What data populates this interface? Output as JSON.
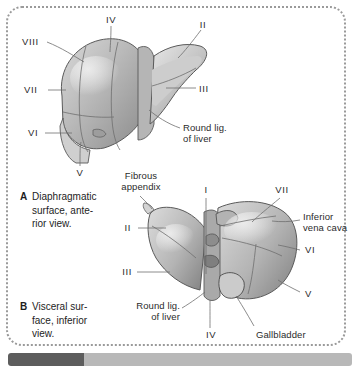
{
  "figure": {
    "panels": [
      {
        "tag": "A",
        "caption": "Diaphragmatic\nsurface, ante-\nrior view.",
        "view": "anterior",
        "labels": [
          {
            "id": "a-seg-8",
            "text": "VIII",
            "type": "segment"
          },
          {
            "id": "a-seg-7",
            "text": "VII",
            "type": "segment"
          },
          {
            "id": "a-seg-6",
            "text": "VI",
            "type": "segment"
          },
          {
            "id": "a-seg-5",
            "text": "V",
            "type": "segment"
          },
          {
            "id": "a-seg-4",
            "text": "IV",
            "type": "segment"
          },
          {
            "id": "a-seg-2",
            "text": "II",
            "type": "segment"
          },
          {
            "id": "a-seg-3",
            "text": "III",
            "type": "segment"
          },
          {
            "id": "a-round-lig",
            "text": "Round lig.\nof liver",
            "type": "structure"
          }
        ]
      },
      {
        "tag": "B",
        "caption": "Visceral sur-\nface, inferior\nview.",
        "view": "inferior",
        "labels": [
          {
            "id": "b-fibrous-appendix",
            "text": "Fibrous\nappendix",
            "type": "structure"
          },
          {
            "id": "b-seg-1",
            "text": "I",
            "type": "segment"
          },
          {
            "id": "b-seg-7",
            "text": "VII",
            "type": "segment"
          },
          {
            "id": "b-ivc",
            "text": "Inferior\nvena cava",
            "type": "structure"
          },
          {
            "id": "b-seg-6",
            "text": "VI",
            "type": "segment"
          },
          {
            "id": "b-seg-5",
            "text": "V",
            "type": "segment"
          },
          {
            "id": "b-seg-2",
            "text": "II",
            "type": "segment"
          },
          {
            "id": "b-seg-3",
            "text": "III",
            "type": "segment"
          },
          {
            "id": "b-round-lig",
            "text": "Round lig.\nof liver",
            "type": "structure"
          },
          {
            "id": "b-seg-4",
            "text": "IV",
            "type": "segment"
          },
          {
            "id": "b-gallbladder",
            "text": "Gallbladder",
            "type": "structure"
          }
        ]
      }
    ]
  },
  "colors": {
    "frame": "#9a9a9a",
    "label_text": "#2b2b2b",
    "caption_text": "#1d1d1d",
    "leader_line": "#6f6f6f",
    "bar_track": "#b8b8b8",
    "bar_segment": "#5d5d5d",
    "organ_light": "#e2e2e2",
    "organ_mid": "#bdbdbd",
    "organ_dark": "#8f8f8f",
    "organ_outline": "#4a4a4a"
  }
}
